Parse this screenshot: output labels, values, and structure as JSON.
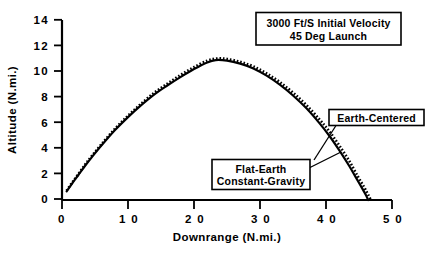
{
  "chart_data": {
    "type": "line",
    "title": "",
    "xlabel": "Downrange  (N.mi.)",
    "ylabel": "Altitude  (N.mi.)",
    "xlim": [
      0,
      50
    ],
    "ylim": [
      0,
      15
    ],
    "xticks": [
      0,
      10,
      20,
      30,
      40,
      50
    ],
    "xtick_labels": [
      "0",
      "1 0",
      "2 0",
      "3 0",
      "4 0",
      "5 0"
    ],
    "yticks": [
      0,
      2,
      4,
      6,
      8,
      10,
      12,
      14
    ],
    "ytick_labels": [
      "0",
      "2",
      "4",
      "6",
      "8",
      "10",
      "12",
      "14"
    ],
    "grid": false,
    "legend_position": "annotations",
    "annotation_title_box": {
      "line1": "3000  Ft/S  Initial  Velocity",
      "line2": "45 Deg Launch"
    },
    "series": [
      {
        "name": "Flat-Earth Constant-Gravity",
        "style": "solid",
        "color": "#000000",
        "x": [
          0.7,
          1.5,
          2.5,
          3.5,
          4.5,
          6.0,
          8.0,
          10.0,
          12.0,
          14.0,
          16.0,
          18.0,
          20.0,
          22.0,
          23.3,
          25.0,
          27.0,
          29.0,
          31.0,
          33.0,
          35.0,
          37.0,
          39.0,
          40.5,
          42.0,
          43.5,
          44.5,
          45.4,
          46.0,
          46.4
        ],
        "y": [
          0.72,
          1.35,
          2.1,
          2.85,
          3.55,
          4.55,
          5.8,
          6.9,
          7.9,
          8.8,
          9.55,
          10.25,
          10.9,
          11.45,
          11.65,
          11.6,
          11.35,
          10.95,
          10.35,
          9.6,
          8.7,
          7.65,
          6.4,
          5.35,
          4.15,
          2.85,
          1.9,
          1.05,
          0.45,
          0.0
        ]
      },
      {
        "name": "Earth-Centered",
        "style": "dotted",
        "color": "#000000",
        "x": [
          0.7,
          1.5,
          2.5,
          3.5,
          4.5,
          6.0,
          8.0,
          10.0,
          12.0,
          14.0,
          16.0,
          18.0,
          20.0,
          22.0,
          23.5,
          25.0,
          27.0,
          29.0,
          31.0,
          33.0,
          35.0,
          37.0,
          39.0,
          40.5,
          42.0,
          43.5,
          44.8,
          45.8,
          46.4,
          46.8
        ],
        "y": [
          0.78,
          1.42,
          2.18,
          2.95,
          3.66,
          4.66,
          5.92,
          7.02,
          8.02,
          8.94,
          9.7,
          10.42,
          11.06,
          11.6,
          11.78,
          11.74,
          11.5,
          11.12,
          10.54,
          9.82,
          8.94,
          7.92,
          6.72,
          5.72,
          4.55,
          3.28,
          1.98,
          1.05,
          0.42,
          0.0
        ]
      }
    ],
    "annotations": [
      {
        "id": "earth-centered",
        "text_lines": [
          "Earth-Centered"
        ],
        "points_to_series": "Earth-Centered"
      },
      {
        "id": "flat-earth",
        "text_lines": [
          "Flat-Earth",
          "Constant-Gravity"
        ],
        "points_to_series": "Flat-Earth Constant-Gravity"
      }
    ]
  }
}
